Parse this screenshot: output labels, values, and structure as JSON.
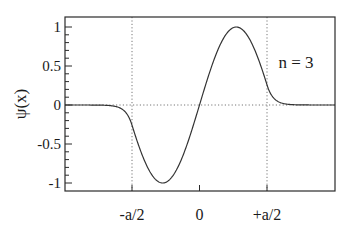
{
  "chart_data": {
    "type": "line",
    "title": "",
    "xlabel": "",
    "ylabel": "ψ(x)",
    "annotation": "n = 3",
    "ylim": [
      -1.1,
      1.1
    ],
    "xlim": [
      -1.0,
      1.0
    ],
    "x_units": "a",
    "yticks": [
      1,
      0.5,
      0,
      -0.5,
      -1
    ],
    "ytick_labels": [
      "1",
      "0.5",
      "0",
      "-0.5",
      "-1"
    ],
    "xticks": [
      -0.5,
      0,
      0.5
    ],
    "xtick_labels": [
      "-a/2",
      "0",
      "+a/2"
    ],
    "grid": false,
    "reference_lines": {
      "horizontal_dotted_at_y": 0,
      "vertical_dotted_at_x": [
        -0.5,
        0.5
      ]
    },
    "legend": null,
    "series": [
      {
        "name": "ψ(x), n = 3 (finite square well, odd state)",
        "model": {
          "inside": "sin(k x), |x| <= a/2",
          "outside": "matched exponential decay, |x| > a/2",
          "k_per_a": 5.76,
          "value_at_well_edge": -0.49
        },
        "x": [
          -1.0,
          -0.8,
          -0.7,
          -0.6,
          -0.55,
          -0.5,
          -0.45,
          -0.4,
          -0.35,
          -0.27,
          -0.2,
          -0.14,
          -0.07,
          0.0,
          0.07,
          0.14,
          0.2,
          0.27,
          0.35,
          0.4,
          0.45,
          0.5,
          0.55,
          0.6,
          0.7,
          0.8,
          1.0
        ],
        "y": [
          0.0,
          0.01,
          0.04,
          0.14,
          0.27,
          0.49,
          0.8,
          0.98,
          0.93,
          0.37,
          -0.4,
          -0.93,
          -0.75,
          0.0,
          0.75,
          0.93,
          0.4,
          -0.37,
          -0.93,
          -0.98,
          -0.8,
          -0.49,
          -0.27,
          -0.14,
          -0.04,
          -0.01,
          0.0
        ]
      }
    ]
  },
  "layout": {
    "plot": {
      "left": 65,
      "right": 335,
      "top": 17,
      "bottom": 191
    },
    "x_zero_px": 199.5,
    "half_width_px": 67.5,
    "y_zero_px": 105,
    "y_unit_px": 78,
    "colors": {
      "axis": "#2a2a2a",
      "curve": "#333333",
      "dotted": "#777777",
      "text": "#1a1a1a",
      "background": "#ffffff"
    }
  }
}
